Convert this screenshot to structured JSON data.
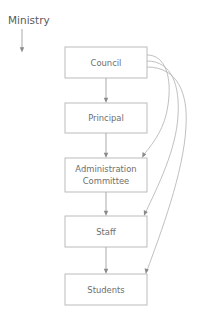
{
  "diagram": {
    "type": "organizational-flow-chart",
    "external_entity": {
      "label": "Ministry",
      "has_arrow_down": true
    },
    "nodes": [
      {
        "id": "council",
        "label": "Council",
        "lines": [
          "Council"
        ]
      },
      {
        "id": "principal",
        "label": "Principal",
        "lines": [
          "Principal"
        ]
      },
      {
        "id": "administration",
        "label": "Administration Committee",
        "lines": [
          "Administration",
          "Committee"
        ]
      },
      {
        "id": "staff",
        "label": "Staff",
        "lines": [
          "Staff"
        ]
      },
      {
        "id": "students",
        "label": "Students",
        "lines": [
          "Students"
        ]
      }
    ],
    "connections": [
      {
        "from": "council",
        "to": "principal",
        "style": "straight"
      },
      {
        "from": "principal",
        "to": "administration",
        "style": "straight"
      },
      {
        "from": "administration",
        "to": "staff",
        "style": "straight"
      },
      {
        "from": "staff",
        "to": "students",
        "style": "straight"
      },
      {
        "from": "council",
        "to": "administration",
        "style": "curved"
      },
      {
        "from": "council",
        "to": "staff",
        "style": "curved"
      },
      {
        "from": "council",
        "to": "students",
        "style": "curved"
      }
    ],
    "colors": {
      "box_stroke": "#b4b4b4",
      "box_fill": "#ffffff",
      "label_text": "#6e6e6e",
      "external_text": "#5a5a5a",
      "connector": "#9a9a9a",
      "curve": "#b0b0b0",
      "background": "#ffffff"
    }
  }
}
